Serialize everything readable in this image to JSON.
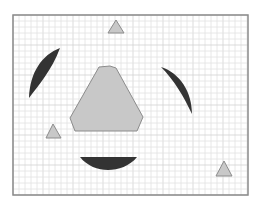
{
  "figure": {
    "frame": {
      "x": 13,
      "y": 15,
      "width": 235,
      "height": 180,
      "stroke": "#8a8a8a"
    },
    "grid": {
      "spacing": 6,
      "color": "#e2e2e2",
      "major_every": 5,
      "major_color": "#d2d2d2"
    },
    "colors": {
      "shape_fill": "#c8c8c8",
      "shape_stroke": "#8c8c8c",
      "crescent_fill": "#333333",
      "background": "#ffffff"
    },
    "shapes": [
      {
        "name": "central-hexagon",
        "type": "polygon",
        "points": "99,67 110,66 116,68 143,117 137,131 75,131 70,118"
      },
      {
        "name": "triangle-top",
        "type": "triangle",
        "points": "116,20 108,33 124,33"
      },
      {
        "name": "triangle-left",
        "type": "triangle",
        "points": "53,124 46,138 61,138"
      },
      {
        "name": "triangle-bottom-right",
        "type": "triangle",
        "points": "224,161 216,176 232,176"
      }
    ],
    "crescents": [
      {
        "name": "crescent-left",
        "path": "M60,48 C42,55 30,72 29,98 C38,86 52,70 60,48 Z"
      },
      {
        "name": "crescent-right",
        "path": "M161,67 C180,73 192,92 192,114 C184,97 174,80 161,67 Z"
      },
      {
        "name": "crescent-bottom",
        "path": "M80,157 L137,157 C130,166 118,170 108,170 C98,170 87,166 80,157 Z"
      }
    ]
  }
}
